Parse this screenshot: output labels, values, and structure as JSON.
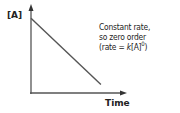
{
  "chart_data": {
    "type": "line",
    "title": "",
    "xlabel": "Time",
    "ylabel": "[A]",
    "x_ticks": [],
    "y_ticks": [],
    "xlim": [
      0,
      1
    ],
    "ylim": [
      0,
      1
    ],
    "grid": false,
    "series": [
      {
        "name": "[A] vs time",
        "x": [
          0,
          0.76
        ],
        "y": [
          0.88,
          0.1
        ]
      }
    ],
    "annotation": {
      "line1": "Constant rate,",
      "line2": "so zero order",
      "line3_prefix": "(rate = ",
      "line3_k": "k",
      "line3_mid": "[A]",
      "line3_exp": "0",
      "line3_suffix": ")"
    }
  },
  "colors": {
    "axis": "#555555",
    "line": "#555555",
    "text": "#222222"
  }
}
